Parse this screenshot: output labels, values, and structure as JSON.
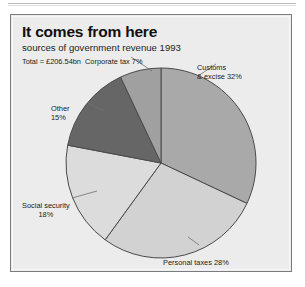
{
  "panel": {
    "title": "It comes from here",
    "subtitle": "sources of government revenue 1993",
    "total_label": "Total = £206.54bn"
  },
  "labels": {
    "corporate": "Corporate tax 7%",
    "customs_line1": "Customs",
    "customs_line2": "& excise 32%",
    "other_line1": "Other",
    "other_line2": "15%",
    "social_line1": "Social security",
    "social_line2": "18%",
    "personal": "Personal taxes 28%"
  },
  "chart_data": {
    "type": "pie",
    "title": "It comes from here",
    "subtitle": "sources of government revenue 1993",
    "annotation": "Total = £206.54bn",
    "units": "percent of total revenue",
    "total": "£206.54bn",
    "year": 1993,
    "start_angle_deg": 0,
    "direction": "clockwise",
    "categories": [
      "Customs & excise",
      "Personal taxes",
      "Social security",
      "Other",
      "Corporate tax"
    ],
    "values": [
      32,
      28,
      18,
      15,
      7
    ],
    "colors": [
      "#a9a9a9",
      "#d2d2d2",
      "#dcdcdc",
      "#666666",
      "#a0a0a0"
    ],
    "legend": "none",
    "grid": false
  },
  "colors": {
    "panel_background": "#ececec",
    "panel_border": "#7c7c7c",
    "slice_stroke": "#4a4a4a",
    "text": "#1b1b1b"
  }
}
